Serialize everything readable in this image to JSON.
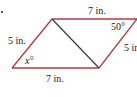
{
  "diagram": {
    "type": "parallelogram-with-diagonal",
    "colors": {
      "edge": "#b03a48",
      "diagonal": "#3a3a3a",
      "text": "#222222"
    },
    "labels": {
      "top_side": "7 in.",
      "bottom_side": "7 in.",
      "left_side": "5 in.",
      "right_side": "5 in.",
      "top_right_angle": "50°",
      "bottom_left_angle": "x°"
    }
  }
}
